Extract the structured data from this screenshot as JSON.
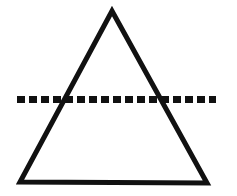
{
  "canvas": {
    "width": 237,
    "height": 196,
    "background_color": "#ffffff",
    "title": "Triangle bisected by a horizontal dashed line"
  },
  "figure": {
    "stroke_color": "#111111",
    "fill_color": "none",
    "shapes": [
      {
        "name": "triangle",
        "type": "polygon",
        "label": "Isosceles triangle",
        "stroke_width": 5,
        "points": [
          {
            "x": 112,
            "y": 11
          },
          {
            "x": 207,
            "y": 183
          },
          {
            "x": 20,
            "y": 182
          }
        ]
      },
      {
        "name": "dashed-line",
        "type": "line",
        "label": "Horizontal dashed line",
        "stroke_width": 7,
        "dash_length": 8,
        "gap_length": 4,
        "x1": 17,
        "y1": 99.5,
        "x2": 216,
        "y2": 99.5
      }
    ]
  }
}
